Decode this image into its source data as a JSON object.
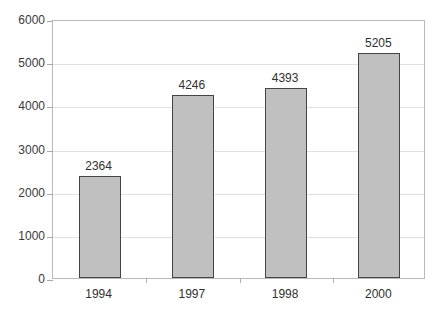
{
  "chart_data": {
    "type": "bar",
    "title": "",
    "title_clipped": true,
    "categories": [
      "1994",
      "1997",
      "1998",
      "2000"
    ],
    "values": [
      2364,
      4246,
      4393,
      5205
    ],
    "value_labels": [
      "2364",
      "4246",
      "4393",
      "5205"
    ],
    "xlabel": "",
    "ylabel": "",
    "ylim": [
      0,
      6000
    ],
    "ytick_labels": [
      "0",
      "1000",
      "2000",
      "3000",
      "4000",
      "5000",
      "6000"
    ],
    "ytick_values": [
      0,
      1000,
      2000,
      3000,
      4000,
      5000,
      6000
    ],
    "grid": true,
    "grid_axis": "y",
    "legend": false,
    "series": [
      {
        "name": "",
        "values": [
          2364,
          4246,
          4393,
          5205
        ],
        "fill_color": "#c0c0c0",
        "border_color": "#454545"
      }
    ]
  },
  "style": {
    "background": "#ffffff",
    "plot_border": "#b9b9b9",
    "gridline_color": "#e2e2e2",
    "tick_color": "#a8a8a8",
    "text_color": "#2f2f2f"
  }
}
